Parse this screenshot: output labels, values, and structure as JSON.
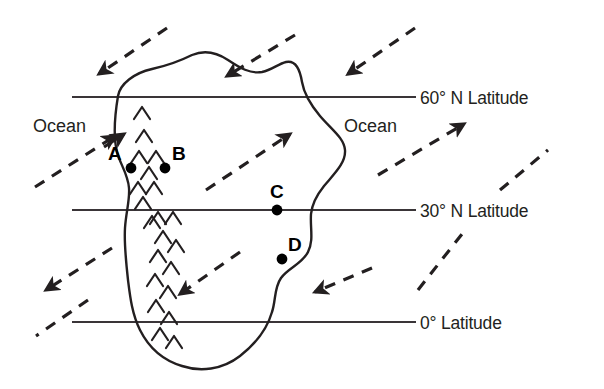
{
  "diagram": {
    "background": "#ffffff",
    "ink": "#231f20",
    "latitude_lines": [
      {
        "id": "lat60",
        "label": "60° N Latitude",
        "y": 97,
        "x_start": 72,
        "x_end": 416,
        "label_x": 420,
        "label_y": 88
      },
      {
        "id": "lat30",
        "label": "30° N Latitude",
        "y": 210,
        "x_start": 72,
        "x_end": 416,
        "label_x": 420,
        "label_y": 201
      },
      {
        "id": "lat0",
        "label": "0° Latitude",
        "y": 322,
        "x_start": 72,
        "x_end": 416,
        "label_x": 420,
        "label_y": 313
      }
    ],
    "ocean_labels": [
      {
        "id": "ocean-west",
        "text": "Ocean",
        "x": 33,
        "y": 116
      },
      {
        "id": "ocean-east",
        "text": "Ocean",
        "x": 344,
        "y": 116
      }
    ],
    "points": [
      {
        "id": "A",
        "label": "A",
        "dot_x": 131,
        "dot_y": 168,
        "label_x": 108,
        "label_y": 143,
        "label_side": "left"
      },
      {
        "id": "B",
        "label": "B",
        "dot_x": 165,
        "dot_y": 168,
        "label_x": 172,
        "label_y": 143,
        "label_side": "right"
      },
      {
        "id": "C",
        "label": "C",
        "dot_x": 277,
        "dot_y": 210,
        "label_x": 270,
        "label_y": 181,
        "label_side": "above"
      },
      {
        "id": "D",
        "label": "D",
        "dot_x": 282,
        "dot_y": 259,
        "label_x": 288,
        "label_y": 234,
        "label_side": "right"
      }
    ],
    "wind_arrows": [
      {
        "id": "wind-nw-1",
        "direction": "west",
        "note": "upper-left, blowing toward west"
      },
      {
        "id": "wind-n-2",
        "direction": "west",
        "note": "upper-middle, blowing toward west"
      },
      {
        "id": "wind-ne-3",
        "direction": "west",
        "note": "upper-right, blowing toward west"
      },
      {
        "id": "wind-w-4",
        "direction": "northeast",
        "note": "left of continent, blowing toward continent coast at A"
      },
      {
        "id": "wind-mid-5",
        "direction": "northeast",
        "note": "over continent, blowing toward northeast"
      },
      {
        "id": "wind-e-6",
        "direction": "northeast",
        "note": "right ocean, blowing toward northeast"
      },
      {
        "id": "wind-sw-7",
        "direction": "southwest",
        "note": "lower-left, blowing toward west"
      },
      {
        "id": "wind-s-8",
        "direction": "west",
        "note": "lower-middle over continent, blowing toward west"
      },
      {
        "id": "wind-se-9",
        "direction": "west",
        "note": "lower-right, blowing toward west"
      },
      {
        "id": "wind-e-10",
        "direction": "northeast",
        "note": "right of continent near 30N, blowing toward northeast"
      }
    ],
    "mountain_range": {
      "id": "mountain-range",
      "symbol": "chevron",
      "note": "north-south chevron range along the west side of the continent"
    },
    "coastline": {
      "id": "continent-outline",
      "note": "irregular closed landmass spanning 0° to above 60° N"
    }
  }
}
